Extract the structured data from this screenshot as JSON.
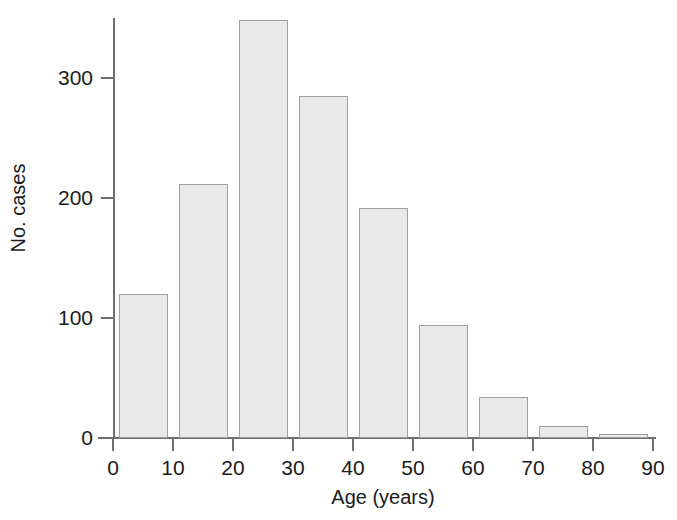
{
  "chart_data": {
    "type": "bar",
    "title": "",
    "subtitle": "",
    "xlabel": "Age (years)",
    "ylabel": "No. cases",
    "categories": [
      "0-10",
      "10-20",
      "20-30",
      "30-40",
      "40-50",
      "50-60",
      "60-70",
      "70-80",
      "80-90"
    ],
    "bin_starts": [
      0,
      10,
      20,
      30,
      40,
      50,
      60,
      70,
      80
    ],
    "bin_width": 10,
    "values": [
      120,
      212,
      348,
      285,
      192,
      94,
      34,
      10,
      3
    ],
    "xlim": [
      0,
      90
    ],
    "ylim": [
      0,
      360
    ],
    "xticks": [
      0,
      10,
      20,
      30,
      40,
      50,
      60,
      70,
      80,
      90
    ],
    "yticks": [
      0,
      100,
      200,
      300
    ],
    "xtick_labels": [
      "0",
      "10",
      "20",
      "30",
      "40",
      "50",
      "60",
      "70",
      "80",
      "90"
    ],
    "ytick_labels": [
      "0",
      "100",
      "200",
      "300"
    ],
    "grid": false,
    "legend": null,
    "annotations": [],
    "colors": {
      "bar_fill": "#e9e9e9",
      "bar_stroke": "#a0a0a0",
      "axis": "#6e6e6e",
      "text": "#1a1a1a",
      "background": "#ffffff"
    }
  }
}
